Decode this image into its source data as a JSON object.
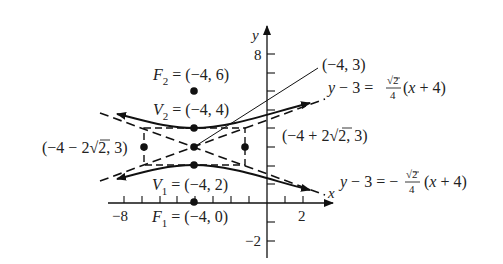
{
  "figure": {
    "type": "hyperbola-graph",
    "equation": "(y - 3)^2 - (x + 4)^2 / 8 = 1",
    "axes": {
      "x_label": "x",
      "y_label": "y",
      "x_ticks_labeled": [
        "-8",
        "2"
      ],
      "y_ticks_labeled": [
        "8",
        "-2"
      ],
      "x_range": [
        -9,
        3
      ],
      "y_range": [
        -2.5,
        9
      ]
    },
    "center": {
      "label": "(-4, 3)",
      "x": -4,
      "y": 3
    },
    "foci": [
      {
        "name": "F",
        "sub": "2",
        "text": " = (-4, 6)",
        "x": -4,
        "y": 6
      },
      {
        "name": "F",
        "sub": "1",
        "text": " = (-4, 0)",
        "x": -4,
        "y": 0
      }
    ],
    "vertices": [
      {
        "name": "V",
        "sub": "2",
        "text": " = (-4, 4)",
        "x": -4,
        "y": 4
      },
      {
        "name": "V",
        "sub": "1",
        "text": " = (-4, 2)",
        "x": -4,
        "y": 2
      }
    ],
    "conjugate_points": [
      {
        "label_pre": "(-4 - 2",
        "label_rad": "2",
        "label_post": ", 3)",
        "x": -6.83,
        "y": 3
      },
      {
        "label_pre": "(-4 + 2",
        "label_rad": "2",
        "label_post": ", 3)",
        "x": -1.17,
        "y": 3
      }
    ],
    "asymptotes": [
      {
        "lhs": "y - 3 = ",
        "sign": "",
        "num": "2",
        "den": "4",
        "rhs": "(x + 4)"
      },
      {
        "lhs": "y - 3 = ",
        "sign": "-",
        "num": "2",
        "den": "4",
        "rhs": "(x + 4)"
      }
    ]
  }
}
